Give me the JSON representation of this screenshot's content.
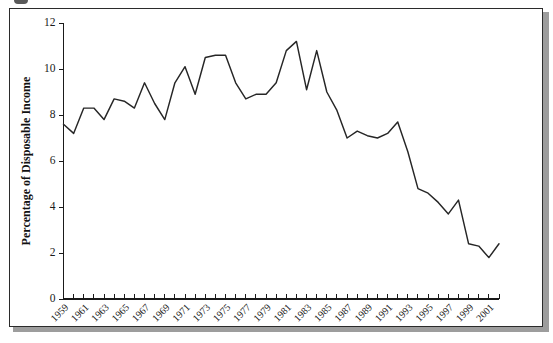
{
  "figure": {
    "panel_background": "#ffffff",
    "border_color": "#2b2b2b",
    "shadow_color": "#9d9d9d",
    "line_color": "#262626",
    "axis_color": "#1a1a1a"
  },
  "chart_data": {
    "type": "line",
    "title": "",
    "xlabel": "",
    "ylabel": "Percentage of Disposable Income",
    "xlim": [
      1959,
      2002
    ],
    "ylim": [
      0,
      12
    ],
    "ytick_labels": [
      "0",
      "2",
      "4",
      "6",
      "8",
      "10",
      "12"
    ],
    "ytick_values": [
      0,
      2,
      4,
      6,
      8,
      10,
      12
    ],
    "grid": false,
    "legend": null,
    "xtick_labels": [
      "1959",
      "1961",
      "1963",
      "1965",
      "1967",
      "1969",
      "1971",
      "1973",
      "1975",
      "1977",
      "1979",
      "1981",
      "1983",
      "1985",
      "1987",
      "1989",
      "1991",
      "1993",
      "1995",
      "1997",
      "1999",
      "2001"
    ],
    "xtick_minor_every": 1,
    "x": [
      1959,
      1960,
      1961,
      1962,
      1963,
      1964,
      1965,
      1966,
      1967,
      1968,
      1969,
      1970,
      1971,
      1972,
      1973,
      1974,
      1975,
      1976,
      1977,
      1978,
      1979,
      1980,
      1981,
      1982,
      1983,
      1984,
      1985,
      1986,
      1987,
      1988,
      1989,
      1990,
      1991,
      1992,
      1993,
      1994,
      1995,
      1996,
      1997,
      1998,
      1999,
      2000,
      2001,
      2002
    ],
    "values": [
      7.6,
      7.2,
      8.3,
      8.3,
      7.8,
      8.7,
      8.6,
      8.3,
      9.4,
      8.5,
      7.8,
      9.4,
      10.1,
      8.9,
      10.5,
      10.6,
      10.6,
      9.4,
      8.7,
      8.9,
      8.9,
      9.4,
      10.8,
      11.2,
      9.1,
      10.8,
      9.0,
      8.2,
      7.0,
      7.3,
      7.1,
      7.0,
      7.2,
      7.7,
      6.4,
      4.8,
      4.6,
      4.2,
      3.7,
      4.3,
      2.4,
      2.3,
      1.8,
      2.4
    ],
    "series": [
      {
        "name": "Personal saving rate",
        "values": [
          7.6,
          7.2,
          8.3,
          8.3,
          7.8,
          8.7,
          8.6,
          8.3,
          9.4,
          8.5,
          7.8,
          9.4,
          10.1,
          8.9,
          10.5,
          10.6,
          10.6,
          9.4,
          8.7,
          8.9,
          8.9,
          9.4,
          10.8,
          11.2,
          9.1,
          10.8,
          9.0,
          8.2,
          7.0,
          7.3,
          7.1,
          7.0,
          7.2,
          7.7,
          6.4,
          4.8,
          4.6,
          4.2,
          3.7,
          4.3,
          2.4,
          2.3,
          1.8,
          2.4
        ]
      }
    ]
  }
}
